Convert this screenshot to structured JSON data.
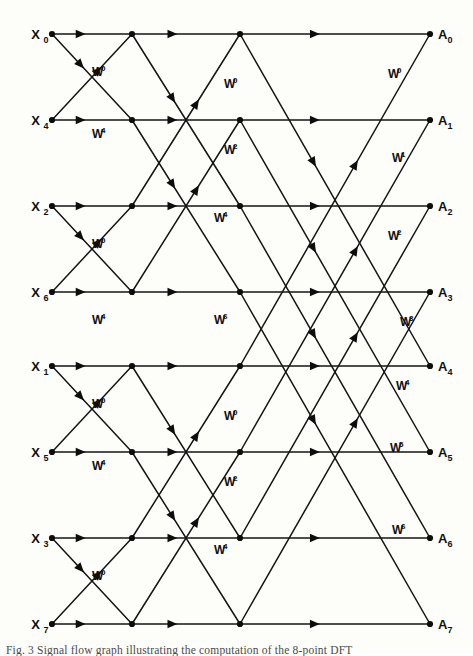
{
  "figure": {
    "caption": "Fig. 3   Signal flow graph illustrating the computation of the 8-point DFT",
    "background_color": "#fdfdfa",
    "line_color": "#141414",
    "rows": 8,
    "stages": 3
  },
  "inputs": [
    {
      "base": "X",
      "sub": "0",
      "row": 0
    },
    {
      "base": "X",
      "sub": "4",
      "row": 1
    },
    {
      "base": "X",
      "sub": "2",
      "row": 2
    },
    {
      "base": "X",
      "sub": "6",
      "row": 3
    },
    {
      "base": "X",
      "sub": "1",
      "row": 4
    },
    {
      "base": "X",
      "sub": "5",
      "row": 5
    },
    {
      "base": "X",
      "sub": "3",
      "row": 6
    },
    {
      "base": "X",
      "sub": "7",
      "row": 7
    }
  ],
  "outputs": [
    {
      "base": "A",
      "sub": "0",
      "row": 0
    },
    {
      "base": "A",
      "sub": "1",
      "row": 1
    },
    {
      "base": "A",
      "sub": "2",
      "row": 2
    },
    {
      "base": "A",
      "sub": "3",
      "row": 3
    },
    {
      "base": "A",
      "sub": "4",
      "row": 4
    },
    {
      "base": "A",
      "sub": "5",
      "row": 5
    },
    {
      "base": "A",
      "sub": "6",
      "row": 6
    },
    {
      "base": "A",
      "sub": "7",
      "row": 7
    }
  ],
  "columns": {
    "input_x": 52,
    "stage1_x": 132,
    "stage2_x": 240,
    "output_x": 430
  },
  "row_y": [
    34,
    120,
    206,
    292,
    366,
    452,
    538,
    624
  ],
  "twiddle_labels": [
    {
      "text": "W",
      "exp": "0",
      "x": 92,
      "y": 76,
      "stage": 1
    },
    {
      "text": "W",
      "exp": "4",
      "x": 92,
      "y": 138,
      "stage": 1
    },
    {
      "text": "W",
      "exp": "0",
      "x": 92,
      "y": 248,
      "stage": 1
    },
    {
      "text": "W",
      "exp": "4",
      "x": 92,
      "y": 324,
      "stage": 1
    },
    {
      "text": "W",
      "exp": "0",
      "x": 92,
      "y": 408,
      "stage": 1
    },
    {
      "text": "W",
      "exp": "4",
      "x": 92,
      "y": 470,
      "stage": 1
    },
    {
      "text": "W",
      "exp": "0",
      "x": 92,
      "y": 580,
      "stage": 1
    },
    {
      "text": "W",
      "exp": "4",
      "x": 92,
      "y": 656,
      "stage": 1
    },
    {
      "text": "W",
      "exp": "0",
      "x": 224,
      "y": 88,
      "stage": 2
    },
    {
      "text": "W",
      "exp": "2",
      "x": 224,
      "y": 154,
      "stage": 2
    },
    {
      "text": "W",
      "exp": "4",
      "x": 214,
      "y": 222,
      "stage": 2
    },
    {
      "text": "W",
      "exp": "6",
      "x": 214,
      "y": 324,
      "stage": 2
    },
    {
      "text": "W",
      "exp": "0",
      "x": 224,
      "y": 420,
      "stage": 2
    },
    {
      "text": "W",
      "exp": "2",
      "x": 224,
      "y": 486,
      "stage": 2
    },
    {
      "text": "W",
      "exp": "4",
      "x": 214,
      "y": 554,
      "stage": 2
    },
    {
      "text": "W",
      "exp": "6",
      "x": 214,
      "y": 656,
      "stage": 2
    },
    {
      "text": "W",
      "exp": "0",
      "x": 388,
      "y": 78,
      "stage": 3
    },
    {
      "text": "W",
      "exp": "1",
      "x": 392,
      "y": 162,
      "stage": 3
    },
    {
      "text": "W",
      "exp": "2",
      "x": 388,
      "y": 240,
      "stage": 3
    },
    {
      "text": "W",
      "exp": "3",
      "x": 400,
      "y": 326,
      "stage": 3
    },
    {
      "text": "W",
      "exp": "4",
      "x": 396,
      "y": 390,
      "stage": 3
    },
    {
      "text": "W",
      "exp": "5",
      "x": 390,
      "y": 452,
      "stage": 3
    },
    {
      "text": "W",
      "exp": "6",
      "x": 392,
      "y": 534,
      "stage": 3
    },
    {
      "text": "W",
      "exp": "7",
      "x": 390,
      "y": 656,
      "stage": 3
    }
  ],
  "edges": {
    "stage1_pairs": [
      [
        0,
        1
      ],
      [
        2,
        3
      ],
      [
        4,
        5
      ],
      [
        6,
        7
      ]
    ],
    "stage2_pairs": [
      [
        0,
        2
      ],
      [
        1,
        3
      ],
      [
        4,
        6
      ],
      [
        5,
        7
      ]
    ],
    "stage3_pairs": [
      [
        0,
        4
      ],
      [
        1,
        5
      ],
      [
        2,
        6
      ],
      [
        3,
        7
      ]
    ]
  }
}
